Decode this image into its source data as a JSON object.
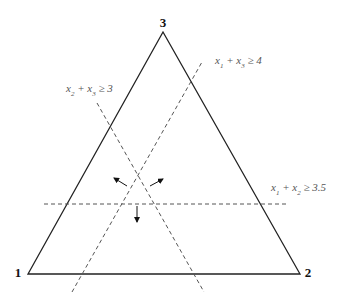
{
  "diagram": {
    "type": "simplex-triangle",
    "vertices": [
      {
        "id": "1",
        "label": "1",
        "x": 28,
        "y": 274,
        "label_x": 18,
        "label_y": 274
      },
      {
        "id": "2",
        "label": "2",
        "x": 300,
        "label_x": 308,
        "y": 274,
        "label_y": 274
      },
      {
        "id": "3",
        "label": "3",
        "x": 163,
        "y": 32,
        "label_x": 163,
        "label_y": 24
      }
    ],
    "constraints": [
      {
        "id": "x1-x3",
        "var_a": "x",
        "sub_a": "1",
        "var_b": "x",
        "sub_b": "3",
        "rhs": "4",
        "text": "x1 + x3 ≥ 4",
        "line": {
          "x1": 72,
          "y1": 292,
          "x2": 202,
          "y2": 62
        },
        "label_x": 215,
        "label_y": 64
      },
      {
        "id": "x2-x3",
        "var_a": "x",
        "sub_a": "2",
        "var_b": "x",
        "sub_b": "3",
        "rhs": "3",
        "text": "x2 + x3 ≥ 3",
        "line": {
          "x1": 97,
          "y1": 103,
          "x2": 204,
          "y2": 292
        },
        "label_x": 66,
        "label_y": 92
      },
      {
        "id": "x1-x2",
        "var_a": "x",
        "sub_a": "1",
        "var_b": "x",
        "sub_b": "2",
        "rhs": "3.5",
        "text": "x1 + x2 ≥ 3.5",
        "line": {
          "x1": 44,
          "y1": 204,
          "x2": 287,
          "y2": 204
        },
        "label_x": 271,
        "label_y": 191
      }
    ],
    "arrows": [
      {
        "name": "arrow-up-left",
        "x1": 127,
        "y1": 186,
        "x2": 114,
        "y2": 178
      },
      {
        "name": "arrow-up-right",
        "x1": 150,
        "y1": 186,
        "x2": 163,
        "y2": 179
      },
      {
        "name": "arrow-down",
        "x1": 137,
        "y1": 206,
        "x2": 137,
        "y2": 222
      }
    ],
    "colors": {
      "triangle": "#222222",
      "dashed": "#555555",
      "arrow": "#111111",
      "label": "#555555"
    }
  }
}
